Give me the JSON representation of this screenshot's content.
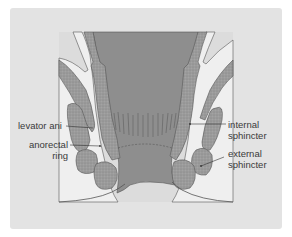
{
  "figure": {
    "colors": {
      "background": "#ffffff",
      "card": "#e3e3e3",
      "panel": "#d9d9d9",
      "lumen": "#8f8f8f",
      "muscle": "#9a9a9a",
      "fat": "#eeeeee",
      "outline": "#555555"
    },
    "labels": {
      "levator_ani": "levator ani",
      "anorectal_ring_line1": "anorectal",
      "anorectal_ring_line2": "ring",
      "internal_sphincter_line1": "internal",
      "internal_sphincter_line2": "sphincter",
      "external_sphincter_line1": "external",
      "external_sphincter_line2": "sphincter"
    }
  }
}
